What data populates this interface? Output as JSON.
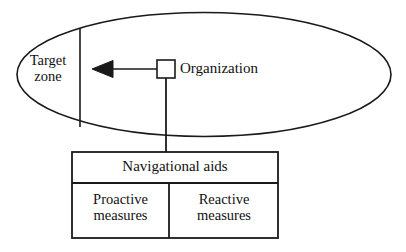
{
  "diagram": {
    "type": "block-diagram",
    "background_color": "#ffffff",
    "stroke_color": "#1a1a1a",
    "ellipse": {
      "name": "target-zone-ellipse",
      "cx": 204,
      "cy": 74.5,
      "rx": 187,
      "ry": 62,
      "stroke_width": 1.6
    },
    "zone_divider": {
      "name": "zone-divider-line",
      "x": 80,
      "y_top": 28,
      "y_bottom": 127,
      "stroke_width": 1.6
    },
    "arrow": {
      "name": "direction-arrow",
      "tip_x": 92,
      "tail_x": 157,
      "y": 69,
      "head_length": 20,
      "head_half_height": 8,
      "stroke_width": 1.6,
      "direction": "left"
    },
    "organization_node": {
      "name": "organization-square",
      "x": 157,
      "y": 60,
      "width": 18,
      "height": 18,
      "stroke_width": 1.6,
      "fill": "#ffffff"
    },
    "connector": {
      "name": "organization-to-aids-connector",
      "x": 166,
      "y_top": 78,
      "y_bottom": 152,
      "stroke_width": 1.8
    },
    "table": {
      "name": "navigational-aids-table",
      "x": 72,
      "y": 152,
      "width": 206,
      "height": 86,
      "header_height": 31,
      "column_divider_x": 169,
      "stroke_width": 1.8
    }
  },
  "labels": {
    "target_zone": "Target\nzone",
    "organization": "Organization",
    "navigational_aids": "Navigational aids",
    "proactive_measures": "Proactive\nmeasures",
    "reactive_measures": "Reactive\nmeasures"
  }
}
